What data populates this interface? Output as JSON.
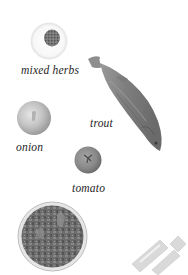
{
  "ingredients": {
    "herbs": {
      "label": "mixed herbs"
    },
    "trout": {
      "label": "trout"
    },
    "onion": {
      "label": "onion"
    },
    "tomato": {
      "label": "tomato"
    }
  },
  "colors": {
    "background": "#ffffff",
    "text": "#1e1e1e",
    "herbs": "#6e6e6e",
    "fish": "#8a8a8a",
    "onion": "#c4c4c4",
    "tomato": "#8c8c8c",
    "bowl": "#6a6a6a",
    "pasta": "#d8d8d8"
  }
}
